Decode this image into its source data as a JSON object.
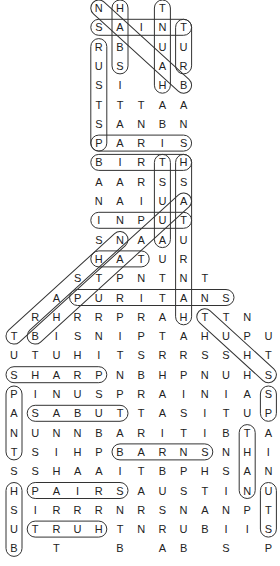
{
  "puzzle": {
    "type": "word-search",
    "grid_origin": {
      "x": 22,
      "y": 8
    },
    "col_spacing": 23.9,
    "row_spacing": 19.5,
    "rows": [
      {
        "r": 0,
        "cells": [
          [
            4,
            "N"
          ],
          [
            5,
            "H"
          ],
          [
            7,
            "T"
          ]
        ]
      },
      {
        "r": 1,
        "cells": [
          [
            4,
            "S"
          ],
          [
            5,
            "A"
          ],
          [
            6,
            "I"
          ],
          [
            7,
            "N"
          ],
          [
            8,
            "T"
          ]
        ]
      },
      {
        "r": 2,
        "cells": [
          [
            4,
            "R"
          ],
          [
            5,
            "B"
          ],
          [
            7,
            "U"
          ],
          [
            8,
            "U"
          ]
        ]
      },
      {
        "r": 3,
        "cells": [
          [
            4,
            "U"
          ],
          [
            5,
            "S"
          ],
          [
            7,
            "A"
          ],
          [
            8,
            "R"
          ]
        ]
      },
      {
        "r": 4,
        "cells": [
          [
            4,
            "S"
          ],
          [
            5,
            "I"
          ],
          [
            7,
            "H"
          ],
          [
            8,
            "B"
          ]
        ]
      },
      {
        "r": 5,
        "cells": [
          [
            4,
            "T"
          ],
          [
            5,
            "T"
          ],
          [
            6,
            "T"
          ],
          [
            7,
            "A"
          ],
          [
            8,
            "A"
          ]
        ]
      },
      {
        "r": 6,
        "cells": [
          [
            4,
            "S"
          ],
          [
            5,
            "A"
          ],
          [
            6,
            "N"
          ],
          [
            7,
            "B"
          ],
          [
            8,
            "N"
          ]
        ]
      },
      {
        "r": 7,
        "cells": [
          [
            4,
            "P"
          ],
          [
            5,
            "A"
          ],
          [
            6,
            "R"
          ],
          [
            7,
            "I"
          ],
          [
            8,
            "S"
          ]
        ]
      },
      {
        "r": 8,
        "cells": [
          [
            4,
            "B"
          ],
          [
            5,
            "I"
          ],
          [
            6,
            "R"
          ],
          [
            7,
            "T"
          ],
          [
            8,
            "H"
          ]
        ]
      },
      {
        "r": 9,
        "cells": [
          [
            4,
            "A"
          ],
          [
            5,
            "A"
          ],
          [
            6,
            "R"
          ],
          [
            7,
            "S"
          ],
          [
            8,
            "S"
          ]
        ]
      },
      {
        "r": 10,
        "cells": [
          [
            4,
            "N"
          ],
          [
            5,
            "A"
          ],
          [
            6,
            "I"
          ],
          [
            7,
            "U"
          ],
          [
            8,
            "A"
          ]
        ]
      },
      {
        "r": 11,
        "cells": [
          [
            4,
            "I"
          ],
          [
            5,
            "N"
          ],
          [
            6,
            "P"
          ],
          [
            7,
            "U"
          ],
          [
            8,
            "T"
          ]
        ]
      },
      {
        "r": 12,
        "cells": [
          [
            4,
            "S"
          ],
          [
            5,
            "N"
          ],
          [
            6,
            "A"
          ],
          [
            7,
            "A"
          ],
          [
            8,
            "U"
          ]
        ]
      },
      {
        "r": 13,
        "cells": [
          [
            4,
            "H"
          ],
          [
            5,
            "A"
          ],
          [
            6,
            "T"
          ],
          [
            7,
            "U"
          ],
          [
            8,
            "R"
          ]
        ]
      },
      {
        "r": 14,
        "cells": [
          [
            3,
            "S"
          ],
          [
            4,
            "T"
          ],
          [
            5,
            "P"
          ],
          [
            6,
            "N"
          ],
          [
            7,
            "T"
          ],
          [
            8,
            "N"
          ],
          [
            9,
            "T"
          ]
        ]
      },
      {
        "r": 15,
        "cells": [
          [
            2,
            "A"
          ],
          [
            3,
            "P"
          ],
          [
            4,
            "U"
          ],
          [
            5,
            "R"
          ],
          [
            6,
            "I"
          ],
          [
            7,
            "T"
          ],
          [
            8,
            "A"
          ],
          [
            9,
            "N"
          ],
          [
            10,
            "S"
          ]
        ]
      },
      {
        "r": 16,
        "cells": [
          [
            1,
            "R"
          ],
          [
            2,
            "H"
          ],
          [
            3,
            "R"
          ],
          [
            4,
            "R"
          ],
          [
            5,
            "P"
          ],
          [
            6,
            "R"
          ],
          [
            7,
            "A"
          ],
          [
            8,
            "H"
          ],
          [
            9,
            "T"
          ],
          [
            10,
            "T"
          ],
          [
            11,
            "N"
          ]
        ]
      },
      {
        "r": 17,
        "cells": [
          [
            0,
            "T"
          ],
          [
            1,
            "B"
          ],
          [
            2,
            "I"
          ],
          [
            3,
            "S"
          ],
          [
            4,
            "N"
          ],
          [
            5,
            "I"
          ],
          [
            6,
            "P"
          ],
          [
            7,
            "T"
          ],
          [
            8,
            "A"
          ],
          [
            9,
            "H"
          ],
          [
            10,
            "U"
          ],
          [
            11,
            "P"
          ],
          [
            12,
            "U"
          ]
        ]
      },
      {
        "r": 18,
        "cells": [
          [
            0,
            "U"
          ],
          [
            1,
            "T"
          ],
          [
            2,
            "U"
          ],
          [
            3,
            "H"
          ],
          [
            4,
            "I"
          ],
          [
            5,
            "T"
          ],
          [
            6,
            "S"
          ],
          [
            7,
            "R"
          ],
          [
            8,
            "R"
          ],
          [
            9,
            "S"
          ],
          [
            10,
            "S"
          ],
          [
            11,
            "H"
          ],
          [
            12,
            "T"
          ]
        ]
      },
      {
        "r": 19,
        "cells": [
          [
            0,
            "S"
          ],
          [
            1,
            "H"
          ],
          [
            2,
            "A"
          ],
          [
            3,
            "R"
          ],
          [
            4,
            "P"
          ],
          [
            5,
            "N"
          ],
          [
            6,
            "B"
          ],
          [
            7,
            "H"
          ],
          [
            8,
            "P"
          ],
          [
            9,
            "N"
          ],
          [
            10,
            "U"
          ],
          [
            11,
            "H"
          ],
          [
            12,
            "S"
          ]
        ]
      },
      {
        "r": 20,
        "cells": [
          [
            0,
            "P"
          ],
          [
            1,
            "I"
          ],
          [
            2,
            "N"
          ],
          [
            3,
            "U"
          ],
          [
            4,
            "S"
          ],
          [
            5,
            "P"
          ],
          [
            6,
            "R"
          ],
          [
            7,
            "A"
          ],
          [
            8,
            "I"
          ],
          [
            9,
            "N"
          ],
          [
            10,
            "I"
          ],
          [
            11,
            "A"
          ],
          [
            12,
            "S"
          ]
        ]
      },
      {
        "r": 21,
        "cells": [
          [
            0,
            "A"
          ],
          [
            1,
            "S"
          ],
          [
            2,
            "A"
          ],
          [
            3,
            "B"
          ],
          [
            4,
            "U"
          ],
          [
            5,
            "T"
          ],
          [
            6,
            "T"
          ],
          [
            7,
            "A"
          ],
          [
            8,
            "S"
          ],
          [
            9,
            "I"
          ],
          [
            10,
            "T"
          ],
          [
            11,
            "U"
          ],
          [
            12,
            "P"
          ]
        ]
      },
      {
        "r": 22,
        "cells": [
          [
            0,
            "N"
          ],
          [
            1,
            "U"
          ],
          [
            2,
            "N"
          ],
          [
            3,
            "N"
          ],
          [
            4,
            "B"
          ],
          [
            5,
            "A"
          ],
          [
            6,
            "R"
          ],
          [
            7,
            "I"
          ],
          [
            8,
            "T"
          ],
          [
            9,
            "I"
          ],
          [
            10,
            "B"
          ],
          [
            11,
            "T"
          ],
          [
            12,
            "A"
          ]
        ]
      },
      {
        "r": 23,
        "cells": [
          [
            0,
            "T"
          ],
          [
            1,
            "S"
          ],
          [
            2,
            "I"
          ],
          [
            3,
            "H"
          ],
          [
            4,
            "P"
          ],
          [
            5,
            "B"
          ],
          [
            6,
            "A"
          ],
          [
            7,
            "R"
          ],
          [
            8,
            "N"
          ],
          [
            9,
            "S"
          ],
          [
            10,
            "N"
          ],
          [
            11,
            "H"
          ],
          [
            12,
            "I"
          ]
        ]
      },
      {
        "r": 24,
        "cells": [
          [
            0,
            "S"
          ],
          [
            1,
            "S"
          ],
          [
            2,
            "H"
          ],
          [
            3,
            "A"
          ],
          [
            4,
            "A"
          ],
          [
            5,
            "I"
          ],
          [
            6,
            "T"
          ],
          [
            7,
            "B"
          ],
          [
            8,
            "P"
          ],
          [
            9,
            "H"
          ],
          [
            10,
            "S"
          ],
          [
            11,
            "A"
          ],
          [
            12,
            "N"
          ]
        ]
      },
      {
        "r": 25,
        "cells": [
          [
            0,
            "H"
          ],
          [
            1,
            "P"
          ],
          [
            2,
            "A"
          ],
          [
            3,
            "I"
          ],
          [
            4,
            "R"
          ],
          [
            5,
            "S"
          ],
          [
            6,
            "A"
          ],
          [
            7,
            "U"
          ],
          [
            8,
            "S"
          ],
          [
            9,
            "T"
          ],
          [
            10,
            "I"
          ],
          [
            11,
            "N"
          ],
          [
            12,
            "U"
          ]
        ]
      },
      {
        "r": 26,
        "cells": [
          [
            0,
            "S"
          ],
          [
            1,
            "I"
          ],
          [
            2,
            "R"
          ],
          [
            3,
            "R"
          ],
          [
            4,
            "R"
          ],
          [
            5,
            "N"
          ],
          [
            6,
            "R"
          ],
          [
            7,
            "S"
          ],
          [
            8,
            "N"
          ],
          [
            9,
            "A"
          ],
          [
            10,
            "N"
          ],
          [
            11,
            "P"
          ],
          [
            12,
            "T"
          ]
        ]
      },
      {
        "r": 27,
        "cells": [
          [
            0,
            "U"
          ],
          [
            1,
            "T"
          ],
          [
            2,
            "R"
          ],
          [
            3,
            "U"
          ],
          [
            4,
            "H"
          ],
          [
            5,
            "T"
          ],
          [
            6,
            "N"
          ],
          [
            7,
            "R"
          ],
          [
            8,
            "U"
          ],
          [
            9,
            "B"
          ],
          [
            10,
            "I"
          ],
          [
            11,
            "I"
          ],
          [
            12,
            "S"
          ]
        ]
      },
      {
        "r": 28,
        "cells": [
          [
            0,
            "B"
          ],
          [
            2,
            "T"
          ],
          [
            5,
            "B"
          ],
          [
            7,
            "A"
          ],
          [
            8,
            "B"
          ],
          [
            10,
            "S"
          ],
          [
            12,
            "P"
          ]
        ]
      }
    ]
  }
}
